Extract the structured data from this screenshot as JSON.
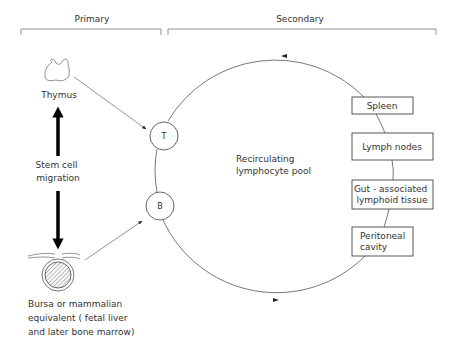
{
  "headers": {
    "primary": "Primary",
    "secondary": "Secondary"
  },
  "primary_organs": {
    "thymus": "Thymus",
    "stem_cell_migration": [
      "Stem cell",
      "migration"
    ],
    "bursa": [
      "Bursa or mammalian",
      "equivalent ( fetal liver",
      "and later bone marrow)"
    ]
  },
  "nodes": {
    "t_cell": "T",
    "b_cell": "B"
  },
  "pool_label": [
    "Recirculating",
    "lymphocyte pool"
  ],
  "secondary_organs": [
    {
      "lines": [
        "Spleen"
      ]
    },
    {
      "lines": [
        "Lymph nodes"
      ]
    },
    {
      "lines": [
        "Gut - associated",
        "lymphoid tissue"
      ]
    },
    {
      "lines": [
        "Peritoneal",
        "cavity"
      ]
    }
  ],
  "icons": {
    "thymus": "thymus-organ-icon",
    "bursa": "bursa-organ-icon"
  },
  "colors": {
    "ink": "#333333",
    "arrow": "#000000"
  }
}
